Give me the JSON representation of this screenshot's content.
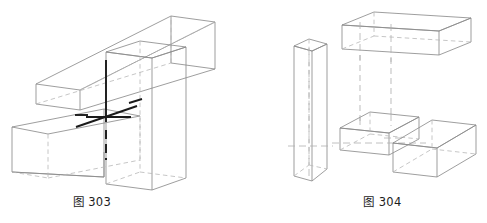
{
  "page": {
    "background_color": "#ffffff",
    "line_color": "#8d8d8d",
    "hidden_line_color": "#b3b3b3",
    "emphasis_line_color": "#1a1a1a",
    "caption_color": "#1c1c1c"
  },
  "figures": [
    {
      "id": "figure-303",
      "caption": "图 303",
      "description": "assembled intersecting rectangular prisms with centre lines",
      "parts": [
        {
          "name": "upper-horizontal-beam",
          "label": "upper beam"
        },
        {
          "name": "lower-horizontal-beam",
          "label": "lower beam"
        },
        {
          "name": "vertical-slab",
          "label": "vertical slab"
        }
      ],
      "centre_lines": [
        {
          "name": "vertical-centre-line",
          "orientation": "vertical"
        },
        {
          "name": "horizontal-centre-line",
          "orientation": "horizontal"
        },
        {
          "name": "oblique-centre-line",
          "orientation": "oblique"
        }
      ]
    },
    {
      "id": "figure-304",
      "caption": "图 304",
      "description": "exploded view of four rectangular prisms with projection lines",
      "parts": [
        {
          "name": "tall-vertical-prism",
          "label": "tall prism"
        },
        {
          "name": "top-long-beam",
          "label": "long beam"
        },
        {
          "name": "middle-small-block",
          "label": "small block"
        },
        {
          "name": "lower-right-block",
          "label": "right block"
        }
      ],
      "projection_lines": [
        {
          "name": "projection-line-left",
          "orientation": "vertical"
        },
        {
          "name": "projection-line-right",
          "orientation": "vertical"
        }
      ]
    }
  ]
}
